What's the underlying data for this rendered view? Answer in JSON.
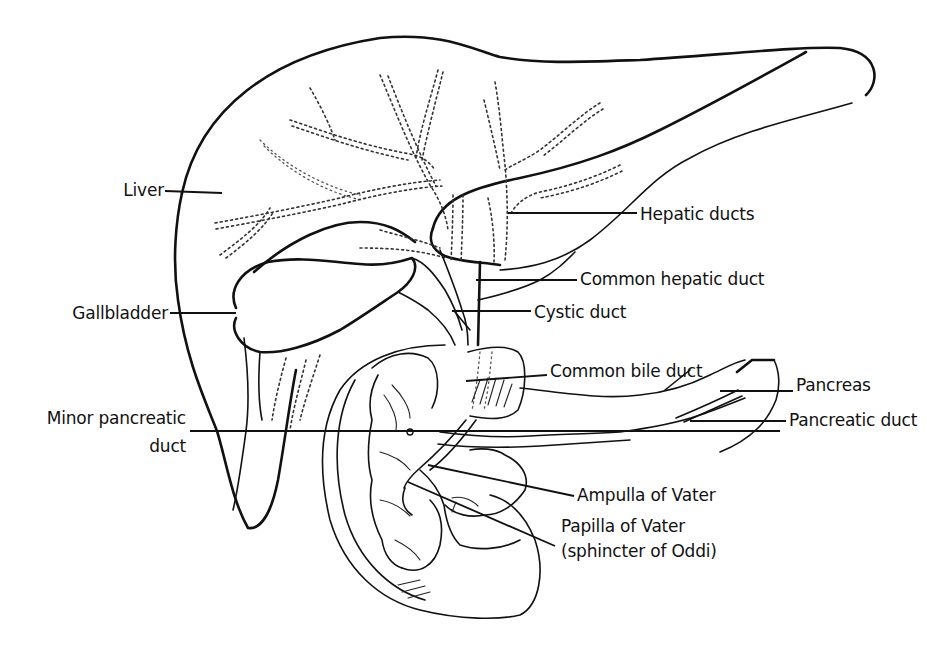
{
  "figure": {
    "stroke_color": "#111111",
    "background": "#ffffff"
  },
  "labels": [
    {
      "id": "liver",
      "text": "Liver",
      "x": 164,
      "y": 196,
      "anchor": "end",
      "line": [
        165,
        191,
        222,
        193
      ]
    },
    {
      "id": "gallbladder",
      "text": "Gallbladder",
      "x": 168,
      "y": 319,
      "anchor": "end",
      "line": [
        170,
        313,
        236,
        313
      ]
    },
    {
      "id": "minor-pancreatic-duct",
      "text": "Minor pancreatic",
      "text2": "duct",
      "x": 186,
      "y": 424,
      "y2": 452,
      "anchor": "end",
      "line": [
        190,
        431,
        780,
        431
      ]
    },
    {
      "id": "hepatic-ducts",
      "text": "Hepatic ducts",
      "x": 640,
      "y": 220,
      "anchor": "start",
      "line": [
        508,
        213,
        637,
        213
      ]
    },
    {
      "id": "common-hepatic-duct",
      "text": "Common hepatic duct",
      "x": 580,
      "y": 285,
      "anchor": "start",
      "line": [
        476,
        280,
        577,
        280
      ]
    },
    {
      "id": "cystic-duct",
      "text": "Cystic duct",
      "x": 534,
      "y": 318,
      "anchor": "start",
      "line": [
        452,
        311,
        531,
        311
      ]
    },
    {
      "id": "common-bile-duct",
      "text": "Common bile duct",
      "x": 550,
      "y": 377,
      "anchor": "start",
      "line": [
        466,
        381,
        547,
        375
      ]
    },
    {
      "id": "pancreas",
      "text": "Pancreas",
      "x": 796,
      "y": 391,
      "anchor": "start",
      "line": [
        720,
        391,
        793,
        391
      ]
    },
    {
      "id": "pancreatic-duct",
      "text": "Pancreatic duct",
      "x": 789,
      "y": 426,
      "anchor": "start",
      "line": [
        690,
        421,
        786,
        421
      ]
    },
    {
      "id": "ampulla-of-vater",
      "text": "Ampulla of Vater",
      "x": 577,
      "y": 501,
      "anchor": "start",
      "line": [
        428,
        465,
        574,
        496
      ]
    },
    {
      "id": "papilla-of-vater",
      "text": "Papilla of Vater",
      "text2": "(sphincter of Oddi)",
      "x": 561,
      "y": 532,
      "y2": 557,
      "anchor": "start",
      "line": [
        408,
        482,
        555,
        546
      ]
    }
  ]
}
